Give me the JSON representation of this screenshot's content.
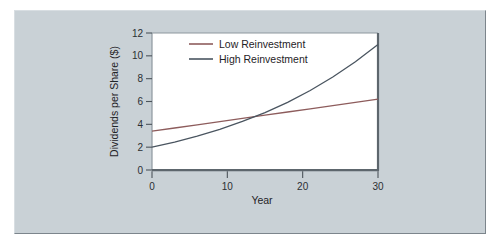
{
  "figure": {
    "panel_background": "#c9d1d6",
    "plot_background": "#ffffff",
    "outer_background": "#ffffff"
  },
  "chart_data": {
    "type": "line",
    "title": "",
    "subtitle": "",
    "xlabel": "Year",
    "ylabel": "Dividends per Share ($)",
    "xlim": [
      0,
      30
    ],
    "ylim": [
      0,
      12
    ],
    "xticks": [
      0,
      10,
      20,
      30
    ],
    "yticks": [
      0,
      2,
      4,
      6,
      8,
      10,
      12
    ],
    "xtick_labels": [
      "0",
      "10",
      "20",
      "30"
    ],
    "ytick_labels": [
      "0",
      "2",
      "4",
      "6",
      "8",
      "10",
      "12"
    ],
    "grid": false,
    "legend_position": "top-center-inside",
    "x": [
      0,
      3,
      6,
      9,
      12,
      15,
      18,
      21,
      24,
      27,
      30
    ],
    "series": [
      {
        "name": "Low Reinvestment",
        "color": "#8d5c5c",
        "values": [
          3.4,
          3.68,
          3.96,
          4.24,
          4.52,
          4.8,
          5.08,
          5.36,
          5.64,
          5.92,
          6.2
        ]
      },
      {
        "name": "High Reinvestment",
        "color": "#4a5560",
        "values": [
          2.0,
          2.45,
          2.97,
          3.56,
          4.25,
          5.03,
          5.93,
          6.96,
          8.14,
          9.48,
          11.0
        ]
      }
    ],
    "annotations": [],
    "crossover": {
      "year": 13,
      "value": 4.6
    }
  },
  "legend": {
    "items": [
      {
        "label": "Low Reinvestment",
        "color": "#8d5c5c"
      },
      {
        "label": "High Reinvestment",
        "color": "#4a5560"
      }
    ]
  },
  "axes": {
    "y_title": "Dividends per Share ($)",
    "x_title": "Year"
  }
}
